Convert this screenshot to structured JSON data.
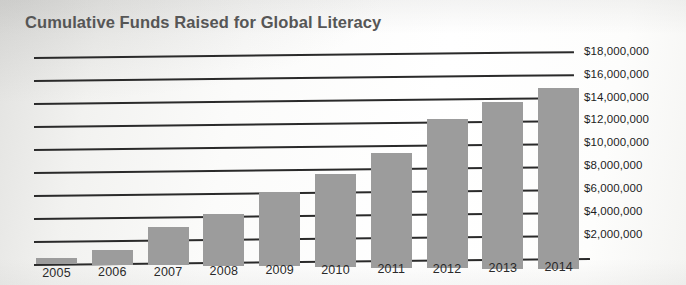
{
  "chart_data": {
    "type": "bar",
    "title": "Cumulative Funds Raised for Global Literacy",
    "xlabel": "",
    "ylabel": "",
    "categories": [
      "2005",
      "2006",
      "2007",
      "2008",
      "2009",
      "2010",
      "2011",
      "2012",
      "2013",
      "2014"
    ],
    "values": [
      500000,
      1300000,
      3300000,
      4500000,
      6500000,
      8100000,
      10000000,
      13000000,
      14500000,
      15800000
    ],
    "ylim": [
      0,
      19000000
    ],
    "ytick_values": [
      2000000,
      4000000,
      6000000,
      8000000,
      10000000,
      12000000,
      14000000,
      16000000,
      18000000
    ],
    "ytick_labels": [
      "$2,000,000",
      "$4,000,000",
      "$6,000,000",
      "$8,000,000",
      "$10,000,000",
      "$12,000,000",
      "$14,000,000",
      "$16,000,000",
      "$18,000,000"
    ],
    "grid": true,
    "grid_axis": "y",
    "legend": false,
    "legend_position": "none",
    "bar_color": "#9c9c9c",
    "grid_color": "#2a2a2a",
    "title_color": "#565656",
    "axis_text_color": "#1d1d1d",
    "background_color": "#fbfbfa"
  }
}
